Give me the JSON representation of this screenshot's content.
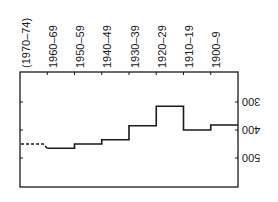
{
  "chart_data": {
    "type": "line",
    "subtype": "step",
    "orientation_note": "image rendered rotated 180 degrees",
    "title": "",
    "xlabel": "",
    "ylabel": "",
    "categories": [
      "1900–9",
      "1910–19",
      "1920–29",
      "1930–39",
      "1940–49",
      "1950–59",
      "1960–69",
      "(1970–74)"
    ],
    "series": [
      {
        "name": "",
        "values": [
          382,
          400,
          315,
          385,
          435,
          450,
          465,
          450
        ],
        "dashed_last": true
      }
    ],
    "yticks": [
      300,
      400,
      500
    ],
    "ylim": [
      200,
      600
    ],
    "grid": false,
    "legend": null
  }
}
